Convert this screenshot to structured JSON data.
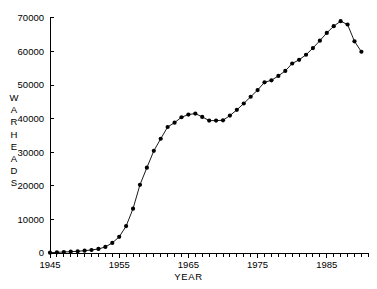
{
  "chart_data": {
    "type": "line",
    "title": "",
    "xlabel": "YEAR",
    "ylabel": "WARHEADS",
    "ylabel_letters": [
      "W",
      "A",
      "R",
      "H",
      "E",
      "A",
      "D",
      "S"
    ],
    "xlim": [
      1945,
      1991
    ],
    "ylim": [
      0,
      70000
    ],
    "grid": false,
    "legend": null,
    "marker": "filled-circle",
    "line_color": "#000000",
    "marker_color": "#000000",
    "background_color": "#ffffff",
    "y_ticks": [
      0,
      10000,
      20000,
      30000,
      40000,
      50000,
      60000,
      70000
    ],
    "y_tick_labels": [
      "0",
      "10000",
      "20000",
      "30000",
      "40000",
      "50000",
      "60000",
      "70000"
    ],
    "x_ticks_major": [
      1945,
      1955,
      1965,
      1975,
      1985
    ],
    "x_tick_labels": [
      "1945",
      "1955",
      "1965",
      "1975",
      "1985"
    ],
    "x_minor_tick_interval": 1,
    "x": [
      1945,
      1946,
      1947,
      1948,
      1949,
      1950,
      1951,
      1952,
      1953,
      1954,
      1955,
      1956,
      1957,
      1958,
      1959,
      1960,
      1961,
      1962,
      1963,
      1964,
      1965,
      1966,
      1967,
      1968,
      1969,
      1970,
      1971,
      1972,
      1973,
      1974,
      1975,
      1976,
      1977,
      1978,
      1979,
      1980,
      1981,
      1982,
      1983,
      1984,
      1985,
      1986,
      1987,
      1988,
      1989,
      1990
    ],
    "y": [
      100,
      200,
      300,
      400,
      500,
      700,
      900,
      1200,
      1800,
      3000,
      4800,
      8000,
      13200,
      20300,
      25400,
      30400,
      34000,
      37500,
      38800,
      40400,
      41200,
      41500,
      40500,
      39400,
      39400,
      39500,
      40900,
      42600,
      44500,
      46500,
      48500,
      50800,
      51400,
      52700,
      54200,
      56400,
      57500,
      59000,
      61000,
      63200,
      65500,
      67500,
      69000,
      68000,
      63000,
      59900
    ],
    "series": [
      {
        "name": "Warheads",
        "values": [
          100,
          200,
          300,
          400,
          500,
          700,
          900,
          1200,
          1800,
          3000,
          4800,
          8000,
          13200,
          20300,
          25400,
          30400,
          34000,
          37500,
          38800,
          40400,
          41200,
          41500,
          40500,
          39400,
          39400,
          39500,
          40900,
          42600,
          44500,
          46500,
          48500,
          50800,
          51400,
          52700,
          54200,
          56400,
          57500,
          59000,
          61000,
          63200,
          65500,
          67500,
          69000,
          68000,
          63000,
          59900
        ]
      }
    ],
    "annotations": [
      {
        "text": "peak stockpile",
        "x": 1987,
        "y": 69000
      },
      {
        "text": "plateau and dip",
        "x": 1968,
        "y": 39400
      }
    ]
  }
}
